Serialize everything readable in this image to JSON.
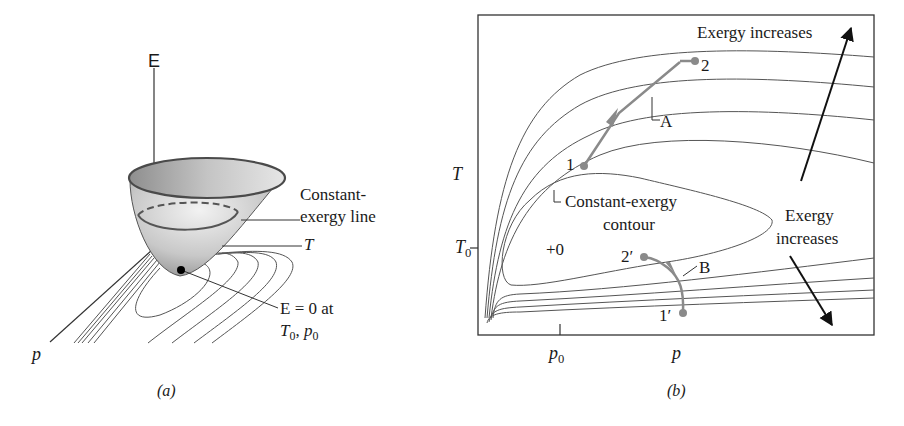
{
  "figure": {
    "panel_a": {
      "caption": "(a)",
      "axis_E_label": "E",
      "axis_T_label": "T",
      "axis_p_label": "p",
      "constant_exergy_label_line1": "Constant-",
      "constant_exergy_label_line2": "exergy line",
      "zero_point_label_line1": "E = 0 at",
      "zero_point_label_line2_T": "T",
      "zero_point_label_line2_T_sub": "0",
      "zero_point_label_line2_sep": ", ",
      "zero_point_label_line2_p": "p",
      "zero_point_label_line2_p_sub": "0"
    },
    "panel_b": {
      "caption": "(b)",
      "y_axis_label": "T",
      "y_tick_label": "T",
      "y_tick_sub": "0",
      "x_tick_label": "p",
      "x_tick_sub": "0",
      "x_axis_label": "p",
      "exergy_increases_top": "Exergy increases",
      "exergy_increases_right_line1": "Exergy",
      "exergy_increases_right_line2": "increases",
      "contour_label_line1": "Constant-exergy",
      "contour_label_line2": "contour",
      "dead_state_label": "+0",
      "process_A_label": "A",
      "process_B_label": "B",
      "point_1": "1",
      "point_2": "2",
      "point_1p": "1′",
      "point_2p": "2′"
    },
    "colors": {
      "line": "#4a4a4a",
      "process_path": "#8a8a8a",
      "arrow": "#111111",
      "surface_light": "#e8e8e8",
      "surface_dark": "#9a9a9a"
    }
  }
}
